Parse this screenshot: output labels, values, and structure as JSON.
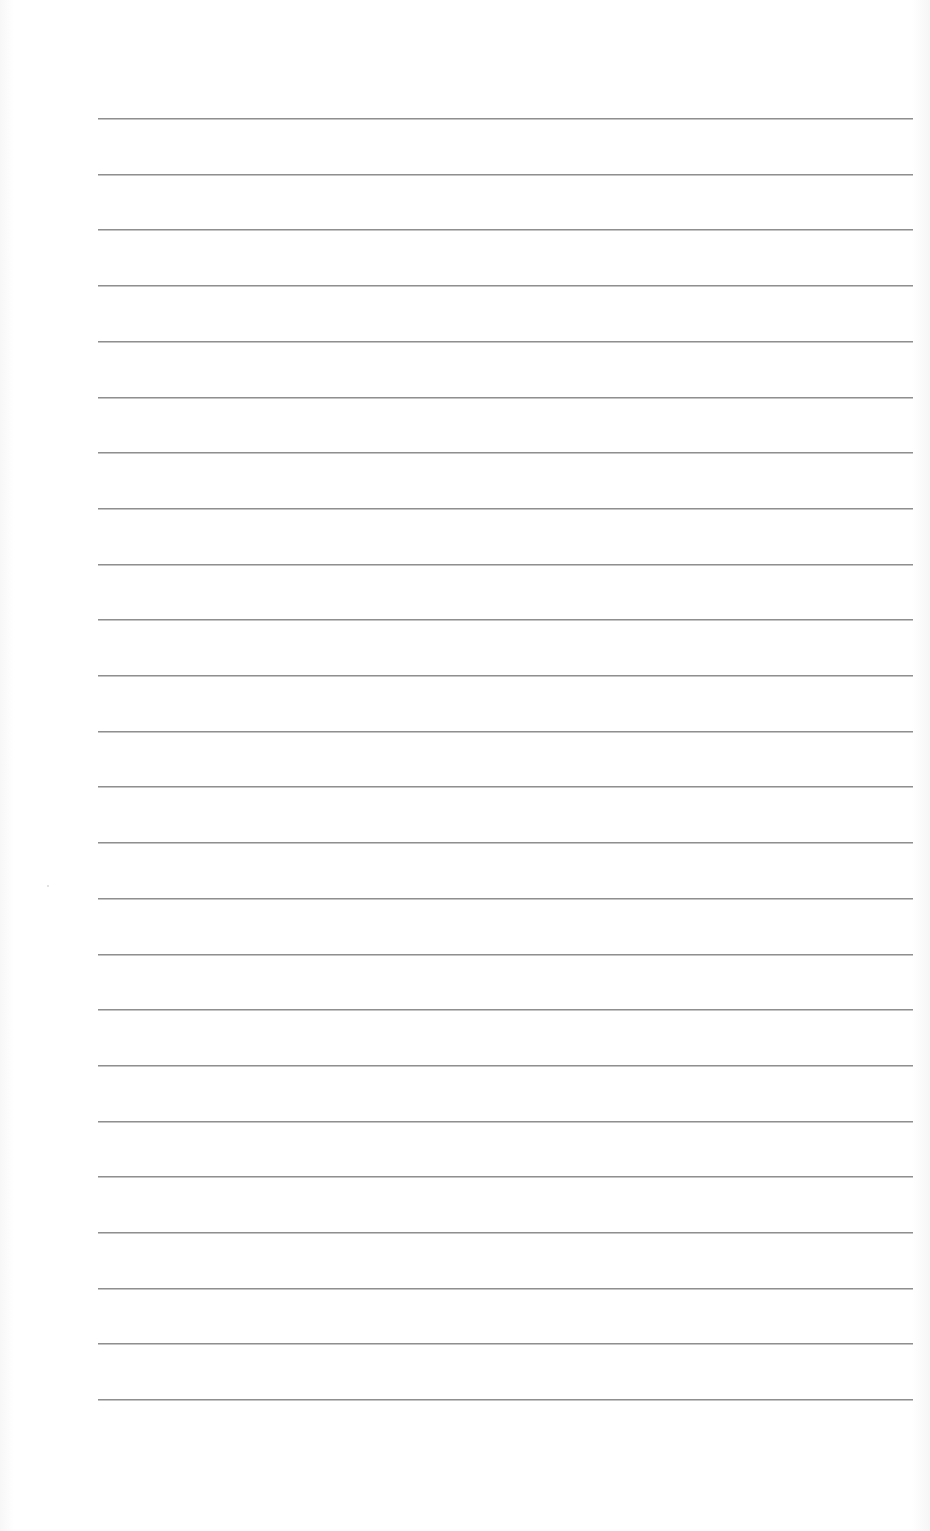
{
  "page": {
    "type": "lined-notebook-page",
    "background_color": "#ffffff",
    "rule_color": "#8f8f8f",
    "rule_count": 24,
    "rule_left_px": 98,
    "rule_right_px": 913,
    "first_rule_y_px": 118,
    "rule_spacing_px": 55.7,
    "text_content": ""
  }
}
